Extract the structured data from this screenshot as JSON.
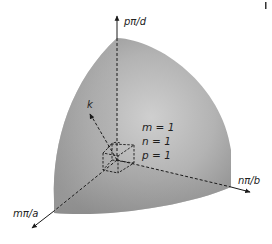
{
  "figure": {
    "type": "octant-of-sphere-in-k-space",
    "axes": {
      "vertical": {
        "label": "pπ/d"
      },
      "right": {
        "label": "nπ/b"
      },
      "left": {
        "label": "mπ/a"
      }
    },
    "vector_label": "k",
    "mode_indices": {
      "m": "m = 1",
      "n": "n = 1",
      "p": "p = 1"
    },
    "colors": {
      "surface_light": "#c8c8c8",
      "surface_mid": "#a9a9a9",
      "surface_dark": "#8a8a8a",
      "lines": "#1a1a1a",
      "background": "#ffffff"
    }
  }
}
